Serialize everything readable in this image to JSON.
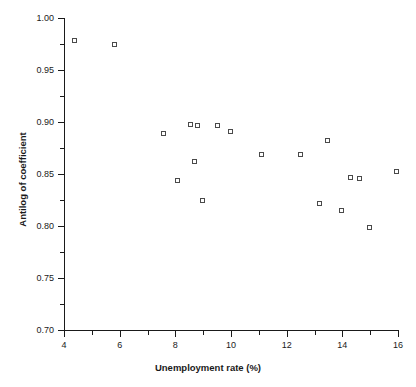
{
  "chart_data": {
    "type": "scatter",
    "title": "",
    "xlabel": "Unemployment rate (%)",
    "ylabel": "Antilog of coefficient",
    "xlim": [
      4,
      16
    ],
    "ylim": [
      0.7,
      1.0
    ],
    "grid": false,
    "legend": null,
    "x_ticks": [
      4,
      5,
      6,
      7,
      8,
      9,
      10,
      11,
      12,
      13,
      14,
      15,
      16
    ],
    "x_tick_labels": [
      "4",
      "",
      "6",
      "",
      "8",
      "",
      "10",
      "",
      "12",
      "",
      "14",
      "",
      "16"
    ],
    "x_major_ticks": [
      4,
      6,
      8,
      10,
      12,
      14,
      16
    ],
    "y_ticks": [
      0.7,
      0.725,
      0.75,
      0.775,
      0.8,
      0.825,
      0.85,
      0.875,
      0.9,
      0.925,
      0.95,
      0.975,
      1.0
    ],
    "y_tick_labels": [
      "0.70",
      "",
      "0.75",
      "",
      "0.80",
      "",
      "0.85",
      "",
      "0.90",
      "",
      "0.95",
      "",
      "1.00"
    ],
    "y_major_ticks": [
      0.7,
      0.75,
      0.8,
      0.85,
      0.9,
      0.95,
      1.0
    ],
    "marker": "open-square",
    "marker_color": "#4a4a4a",
    "marker_fill": "#ffffff",
    "points": [
      {
        "x": 4.4,
        "y": 0.978
      },
      {
        "x": 5.85,
        "y": 0.974
      },
      {
        "x": 7.6,
        "y": 0.888
      },
      {
        "x": 8.1,
        "y": 0.843
      },
      {
        "x": 8.55,
        "y": 0.897
      },
      {
        "x": 8.8,
        "y": 0.896
      },
      {
        "x": 8.7,
        "y": 0.862
      },
      {
        "x": 9.0,
        "y": 0.824
      },
      {
        "x": 9.55,
        "y": 0.896
      },
      {
        "x": 10.0,
        "y": 0.89
      },
      {
        "x": 11.1,
        "y": 0.868
      },
      {
        "x": 12.5,
        "y": 0.868
      },
      {
        "x": 13.2,
        "y": 0.821
      },
      {
        "x": 13.5,
        "y": 0.882
      },
      {
        "x": 14.0,
        "y": 0.814
      },
      {
        "x": 14.3,
        "y": 0.846
      },
      {
        "x": 14.65,
        "y": 0.845
      },
      {
        "x": 15.0,
        "y": 0.798
      },
      {
        "x": 15.95,
        "y": 0.852
      }
    ]
  }
}
